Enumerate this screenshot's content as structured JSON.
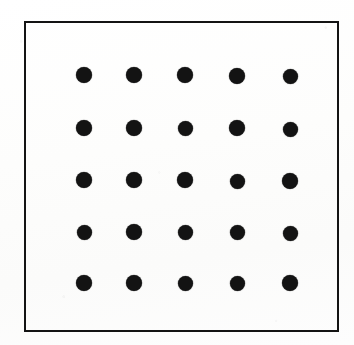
{
  "figure": {
    "kind": "dot-grid-scatter-figure",
    "title": "",
    "caption": "",
    "canvas": {
      "width": 354,
      "height": 345
    },
    "background_color": "#fefefe",
    "frame": {
      "x": 24,
      "y": 21,
      "width": 315,
      "height": 311,
      "border_color": "#141414",
      "border_width": 2.5,
      "fill_color": "transparent"
    },
    "marker": {
      "shape": "circle",
      "color": "#131313",
      "diameter": 16,
      "count": 25
    }
  },
  "chart_data": {
    "type": "scatter",
    "title": "",
    "subtitle": "",
    "xlabel": "",
    "ylabel": "",
    "xlim": [
      0,
      6
    ],
    "ylim": [
      0,
      6
    ],
    "xticks": [],
    "yticks": [],
    "xticklabels": [],
    "yticklabels": [],
    "grid": false,
    "legend": null,
    "annotations": [],
    "rows": 5,
    "columns": 5,
    "marker_color": "#131313",
    "marker_diameter_px": 16,
    "column_centers_px": [
      82,
      132,
      183,
      235,
      288
    ],
    "row_centers_px": [
      73,
      126,
      178,
      230,
      281
    ],
    "x": [
      1,
      2,
      3,
      4,
      5,
      1,
      2,
      3,
      4,
      5,
      1,
      2,
      3,
      4,
      5,
      1,
      2,
      3,
      4,
      5,
      1,
      2,
      3,
      4,
      5
    ],
    "y": [
      5,
      5,
      5,
      5,
      5,
      4,
      4,
      4,
      4,
      4,
      3,
      3,
      3,
      3,
      3,
      2,
      2,
      2,
      2,
      2,
      1,
      1,
      1,
      1,
      1
    ],
    "points": [
      {
        "cx": 82,
        "cy": 73,
        "d": 16
      },
      {
        "cx": 132,
        "cy": 73,
        "d": 16
      },
      {
        "cx": 183,
        "cy": 73,
        "d": 16
      },
      {
        "cx": 235,
        "cy": 74,
        "d": 16
      },
      {
        "cx": 288,
        "cy": 74,
        "d": 15
      },
      {
        "cx": 82,
        "cy": 126,
        "d": 16
      },
      {
        "cx": 132,
        "cy": 126,
        "d": 16
      },
      {
        "cx": 183,
        "cy": 126,
        "d": 15
      },
      {
        "cx": 235,
        "cy": 126,
        "d": 16
      },
      {
        "cx": 288,
        "cy": 127,
        "d": 15
      },
      {
        "cx": 82,
        "cy": 178,
        "d": 16
      },
      {
        "cx": 132,
        "cy": 178,
        "d": 16
      },
      {
        "cx": 183,
        "cy": 178,
        "d": 16
      },
      {
        "cx": 235,
        "cy": 179,
        "d": 15
      },
      {
        "cx": 288,
        "cy": 179,
        "d": 16
      },
      {
        "cx": 82,
        "cy": 230,
        "d": 15
      },
      {
        "cx": 132,
        "cy": 230,
        "d": 16
      },
      {
        "cx": 183,
        "cy": 230,
        "d": 15
      },
      {
        "cx": 235,
        "cy": 230,
        "d": 15
      },
      {
        "cx": 288,
        "cy": 231,
        "d": 15
      },
      {
        "cx": 82,
        "cy": 281,
        "d": 16
      },
      {
        "cx": 132,
        "cy": 281,
        "d": 16
      },
      {
        "cx": 183,
        "cy": 281,
        "d": 15
      },
      {
        "cx": 235,
        "cy": 281,
        "d": 15
      },
      {
        "cx": 288,
        "cy": 281,
        "d": 16
      }
    ]
  }
}
